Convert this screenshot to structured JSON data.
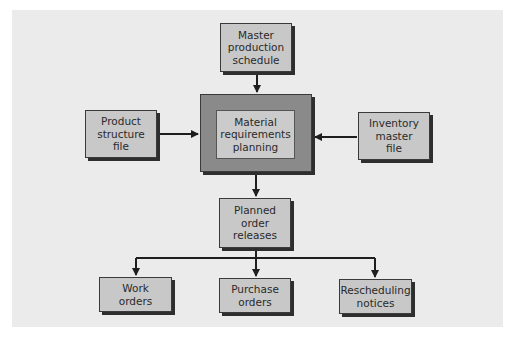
{
  "diagram": {
    "type": "flowchart",
    "colors": {
      "background": "#ebebeb",
      "box_fill": "#c8c8c8",
      "mrp_outer_fill": "#8a8a8a",
      "line": "#1e1e1e"
    },
    "nodes": {
      "master": {
        "label": "Master\nproduction\nschedule"
      },
      "mrp": {
        "label": "Material\nrequirements\nplanning"
      },
      "product": {
        "label": "Product\nstructure\nfile"
      },
      "inventory": {
        "label": "Inventory\nmaster\nfile"
      },
      "planned": {
        "label": "Planned\norder\nreleases"
      },
      "work": {
        "label": "Work\norders"
      },
      "purchase": {
        "label": "Purchase\norders"
      },
      "resched": {
        "label": "Rescheduling\nnotices"
      }
    },
    "edges": [
      {
        "from": "master",
        "to": "mrp"
      },
      {
        "from": "product",
        "to": "mrp"
      },
      {
        "from": "inventory",
        "to": "mrp"
      },
      {
        "from": "mrp",
        "to": "planned"
      },
      {
        "from": "planned",
        "to": "work"
      },
      {
        "from": "planned",
        "to": "purchase"
      },
      {
        "from": "planned",
        "to": "resched"
      }
    ]
  }
}
